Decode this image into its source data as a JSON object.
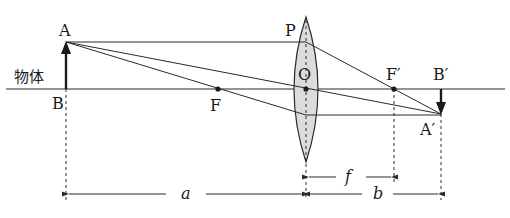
{
  "diagram": {
    "labels": {
      "object_top": "A",
      "object_bottom": "B",
      "object_caption": "物体",
      "lens_top": "P",
      "lens_center": "O",
      "focus_front": "F",
      "focus_back": "F′",
      "image_top": "B′",
      "image_tip": "A′",
      "dim_f": "f",
      "dim_a": "a",
      "dim_b": "b"
    },
    "colors": {
      "line": "#2a2a2a",
      "lens_fill": "#dcdcdc",
      "background": "#ffffff"
    }
  }
}
